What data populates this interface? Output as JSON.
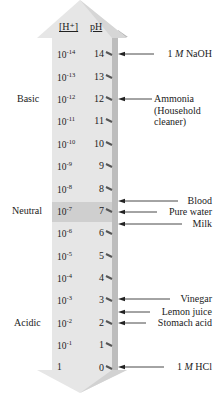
{
  "headers": {
    "concentration": "[H⁺]",
    "ph": "pH"
  },
  "regions": [
    {
      "id": "basic",
      "label": "Basic",
      "y": 99
    },
    {
      "id": "neutral",
      "label": "Neutral",
      "y": 211
    },
    {
      "id": "acidic",
      "label": "Acidic",
      "y": 323
    }
  ],
  "scale": [
    {
      "ph": "14",
      "base": "10",
      "exp": "-14",
      "y": 54
    },
    {
      "ph": "13",
      "base": "10",
      "exp": "-13",
      "y": 77
    },
    {
      "ph": "12",
      "base": "10",
      "exp": "-12",
      "y": 99
    },
    {
      "ph": "11",
      "base": "10",
      "exp": "-11",
      "y": 121
    },
    {
      "ph": "10",
      "base": "10",
      "exp": "-10",
      "y": 144
    },
    {
      "ph": "9",
      "base": "10",
      "exp": "-9",
      "y": 166
    },
    {
      "ph": "8",
      "base": "10",
      "exp": "-8",
      "y": 189
    },
    {
      "ph": "7",
      "base": "10",
      "exp": "-7",
      "y": 211
    },
    {
      "ph": "6",
      "base": "10",
      "exp": "-6",
      "y": 233
    },
    {
      "ph": "5",
      "base": "10",
      "exp": "-5",
      "y": 256
    },
    {
      "ph": "4",
      "base": "10",
      "exp": "-4",
      "y": 278
    },
    {
      "ph": "3",
      "base": "10",
      "exp": "-3",
      "y": 300
    },
    {
      "ph": "2",
      "base": "10",
      "exp": "-2",
      "y": 323
    },
    {
      "ph": "1",
      "base": "10",
      "exp": "-1",
      "y": 345
    },
    {
      "ph": "0",
      "base": "1",
      "exp": "",
      "y": 368
    }
  ],
  "substances": [
    {
      "id": "naoh",
      "prefix": "1 ",
      "italic": "M",
      "suffix": " NaOH",
      "y": 54,
      "arrow_end": 154
    },
    {
      "id": "ammonia",
      "label": "Ammonia\n(Household\ncleaner)",
      "y": 99,
      "arrow_end": 152
    },
    {
      "id": "blood",
      "label": "Blood",
      "y": 201,
      "arrow_end": 178
    },
    {
      "id": "pure-water",
      "label": "Pure water",
      "y": 212,
      "arrow_end": 157
    },
    {
      "id": "milk",
      "label": "Milk",
      "y": 224,
      "arrow_end": 182
    },
    {
      "id": "vinegar",
      "label": "Vinegar",
      "y": 299,
      "arrow_end": 170
    },
    {
      "id": "lemon-juice",
      "label": "Lemon juice",
      "y": 312,
      "arrow_end": 150
    },
    {
      "id": "stomach-acid",
      "label": "Stomach acid",
      "y": 323,
      "arrow_end": 146
    },
    {
      "id": "hcl",
      "prefix": "1 ",
      "italic": "M",
      "suffix": " HCl",
      "y": 367,
      "arrow_end": 164
    }
  ],
  "colors": {
    "arrow_face": "#e6e6e6",
    "arrow_shadow": "#b9b9b9",
    "neutral_band": "#cfcfcf",
    "tick": "#555555",
    "text": "#222222"
  }
}
